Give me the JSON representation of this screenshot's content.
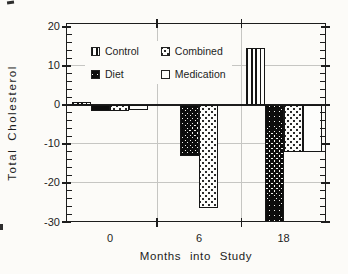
{
  "chart_data": {
    "type": "bar",
    "title": "",
    "xlabel": "Months into Study",
    "ylabel": "Total Cholesterol",
    "categories": [
      "0",
      "6",
      "18"
    ],
    "x_numeric": [
      0,
      6,
      18
    ],
    "series": [
      {
        "name": "Control",
        "pattern": "vertical-stripes",
        "values": [
          0.7,
          0,
          14.5
        ]
      },
      {
        "name": "Diet",
        "pattern": "dense-crosshatch",
        "values": [
          -1.5,
          -13,
          -30
        ]
      },
      {
        "name": "Combined",
        "pattern": "light-dots",
        "values": [
          -1.5,
          -26.5,
          -12
        ]
      },
      {
        "name": "Medication",
        "pattern": "plain-white",
        "values": [
          -1.2,
          0,
          -12
        ]
      }
    ],
    "ylim": [
      -30,
      21
    ],
    "yticks": [
      20,
      10,
      0,
      -10,
      -20,
      -30
    ],
    "minor_tick_step": 2,
    "grid": true,
    "legend": {
      "items": [
        "Control",
        "Diet",
        "Combined",
        "Medication"
      ],
      "position": "top-left-inside"
    },
    "colors": {
      "ink": "#1d1d1d",
      "grid": "#c6c6c3",
      "paper": "#fcfbf8"
    }
  }
}
